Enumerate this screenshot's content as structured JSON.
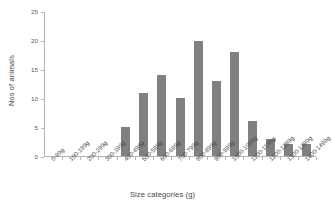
{
  "chart_data": {
    "type": "bar",
    "title": "",
    "xlabel": "Size categories (g)",
    "ylabel": "Nos of animals",
    "categories": [
      "0-99g",
      "100-199g",
      "200-299g",
      "300-399g",
      "400-499g",
      "500-599g",
      "600-699g",
      "700-799g",
      "800-899g",
      "900-999g",
      "1000-1099g",
      "1100-1199g",
      "1200-1299g",
      "1300-1399g",
      "1400-1499g"
    ],
    "values": [
      0,
      0,
      0,
      0,
      5,
      11,
      14,
      10,
      20,
      13,
      18,
      6,
      3,
      2,
      2
    ],
    "ylim": [
      0,
      25
    ],
    "yticks": [
      0,
      5,
      10,
      15,
      20,
      25
    ],
    "ytick_labels": [
      "0",
      "5",
      "10",
      "15",
      "20",
      "25"
    ],
    "grid": false,
    "legend": null,
    "bar_color": "#808080",
    "axis_color": "#b4b4b4",
    "text_color": "#4a4a4a"
  }
}
